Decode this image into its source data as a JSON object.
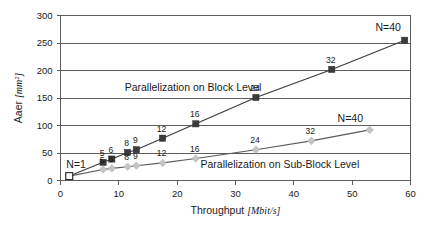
{
  "chart_data": {
    "type": "scatter",
    "title": "",
    "xlabel": "Throughput",
    "xlabel_unit": "[Mbit/s]",
    "ylabel": "Aaer",
    "ylabel_unit": "[mm²]",
    "xlim": [
      0,
      60
    ],
    "ylim": [
      0,
      300
    ],
    "xticks": [
      0,
      10,
      20,
      30,
      40,
      50,
      60
    ],
    "yticks": [
      0,
      50,
      100,
      150,
      200,
      250,
      300
    ],
    "grid": "horizontal",
    "legend_position": "inline-annotation",
    "annotations": [
      {
        "text": "Parallelization on Block Level",
        "x": 11.0,
        "y": 163
      },
      {
        "text": "Parallelization on Sub-Block Level",
        "x": 24.0,
        "y": 23
      },
      {
        "text": "N=1",
        "x": 1.0,
        "y": 22
      },
      {
        "text": "N=40",
        "x": 54.0,
        "y": 272
      },
      {
        "text": "N=40",
        "x": 47.5,
        "y": 107
      }
    ],
    "series": [
      {
        "name": "Parallelization on Block Level",
        "marker": "square",
        "color": "#3b3b3b",
        "points": [
          {
            "N": 1,
            "x": 1.5,
            "y": 8,
            "label": ""
          },
          {
            "N": 5,
            "x": 7.3,
            "y": 33,
            "label": "5"
          },
          {
            "N": 6,
            "x": 8.8,
            "y": 39,
            "label": "6"
          },
          {
            "N": 8,
            "x": 11.5,
            "y": 51,
            "label": "8"
          },
          {
            "N": 9,
            "x": 13.0,
            "y": 56,
            "label": "9"
          },
          {
            "N": 12,
            "x": 17.5,
            "y": 77,
            "label": "12"
          },
          {
            "N": 16,
            "x": 23.2,
            "y": 103,
            "label": "16"
          },
          {
            "N": 24,
            "x": 33.5,
            "y": 151,
            "label": "24"
          },
          {
            "N": 32,
            "x": 46.5,
            "y": 202,
            "label": "32"
          },
          {
            "N": 40,
            "x": 59.0,
            "y": 255,
            "label": ""
          }
        ]
      },
      {
        "name": "Parallelization on Sub-Block Level",
        "marker": "diamond",
        "color": "#c4c4c4",
        "points": [
          {
            "N": 1,
            "x": 1.5,
            "y": 8,
            "label": ""
          },
          {
            "N": 5,
            "x": 7.3,
            "y": 20,
            "label": "5"
          },
          {
            "N": 6,
            "x": 8.8,
            "y": 22,
            "label": "6"
          },
          {
            "N": 8,
            "x": 11.5,
            "y": 25,
            "label": "8"
          },
          {
            "N": 9,
            "x": 13.0,
            "y": 27,
            "label": "9"
          },
          {
            "N": 12,
            "x": 17.5,
            "y": 32,
            "label": "12"
          },
          {
            "N": 16,
            "x": 23.2,
            "y": 40,
            "label": "16"
          },
          {
            "N": 24,
            "x": 33.5,
            "y": 56,
            "label": "24"
          },
          {
            "N": 32,
            "x": 43.0,
            "y": 72,
            "label": "32"
          },
          {
            "N": 40,
            "x": 53.0,
            "y": 92,
            "label": ""
          }
        ]
      }
    ]
  },
  "footer": {
    "caption_stub": ""
  }
}
